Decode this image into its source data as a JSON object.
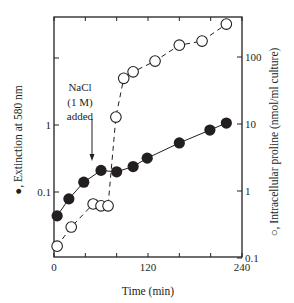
{
  "chart_data": {
    "type": "scatter",
    "title": "",
    "xlabel": "Time (min)",
    "ylabel_left": "●, Extinction at 580 nm",
    "ylabel_right": "○, Intracellular proline (nmol/ml culture)",
    "x_ticks": [
      0,
      40,
      80,
      120,
      160,
      200,
      240
    ],
    "x_tick_labels": [
      "0",
      "",
      "",
      "120",
      "",
      "",
      "240"
    ],
    "xlim": [
      0,
      240
    ],
    "ylim_left": [
      0.01,
      40
    ],
    "ylim_right": [
      0.1,
      400
    ],
    "y_left_scale": "log",
    "y_right_scale": "log",
    "y_left_ticks": [
      0.01,
      0.1,
      1,
      10
    ],
    "y_left_tick_labels": [
      "0.01",
      "0.1",
      "1",
      ""
    ],
    "y_right_ticks": [
      0.1,
      1,
      10,
      100
    ],
    "y_right_tick_labels": [
      "0.1",
      "1",
      "10",
      "100"
    ],
    "grid": false,
    "legend": "none (markers identified in axis titles)",
    "series": [
      {
        "name": "Extinction at 580 nm",
        "marker": "filled-circle",
        "line": "solid",
        "axis": "left",
        "x": [
          4,
          19,
          38,
          60,
          80,
          101,
          119,
          160,
          199,
          220
        ],
        "values": [
          0.044,
          0.079,
          0.14,
          0.21,
          0.2,
          0.24,
          0.32,
          0.54,
          0.84,
          1.07
        ]
      },
      {
        "name": "Intracellular proline (nmol/ml culture)",
        "marker": "open-circle",
        "line": "dashed",
        "axis": "right",
        "x": [
          4,
          22,
          50,
          60,
          69,
          79,
          89,
          101,
          129,
          160,
          189,
          220
        ],
        "values": [
          0.15,
          0.29,
          0.64,
          0.6,
          0.6,
          12.7,
          48,
          60,
          87,
          150,
          173,
          310
        ]
      }
    ],
    "annotations": [
      {
        "text_lines": [
          "NaCl",
          "(1 M)",
          "added"
        ],
        "arrow_x": 49,
        "arrow": "down"
      }
    ]
  },
  "colors": {
    "ink": "#231f20",
    "background": "#ffffff"
  }
}
